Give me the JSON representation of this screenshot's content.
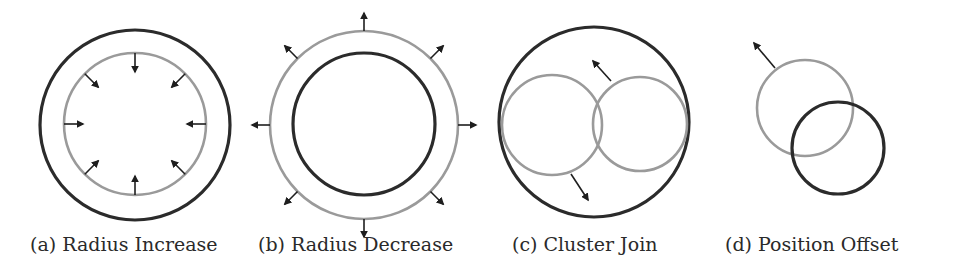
{
  "figure": {
    "colors": {
      "dark": "#2b2b2b",
      "gray": "#9a9a9a",
      "arrow": "#1e1e1e",
      "background": "#ffffff"
    },
    "panels": [
      {
        "id": "a",
        "caption": "(a) Radius Increase",
        "circles": [
          {
            "role": "outer",
            "cx": 135,
            "cy": 125,
            "r": 95,
            "color": "dark"
          },
          {
            "role": "inner",
            "cx": 135,
            "cy": 124,
            "r": 71,
            "color": "gray"
          }
        ],
        "arrows": {
          "center": [
            135,
            124
          ],
          "from_r": 71,
          "to_r": 52,
          "count": 8,
          "direction": "inward"
        }
      },
      {
        "id": "b",
        "caption": "(b) Radius Decrease",
        "circles": [
          {
            "role": "outer",
            "cx": 364,
            "cy": 125,
            "r": 94,
            "color": "gray"
          },
          {
            "role": "inner",
            "cx": 364,
            "cy": 124,
            "r": 71,
            "color": "dark"
          }
        ],
        "arrows": {
          "center": [
            364,
            125
          ],
          "from_r": 94,
          "to_r": 112,
          "count": 8,
          "direction": "outward"
        }
      },
      {
        "id": "c",
        "caption": "(c) Cluster Join",
        "circles": [
          {
            "role": "outer",
            "cx": 594,
            "cy": 122,
            "r": 95,
            "color": "dark"
          },
          {
            "role": "left",
            "cx": 552,
            "cy": 125,
            "r": 50,
            "color": "gray"
          },
          {
            "role": "right",
            "cx": 640,
            "cy": 124,
            "r": 47,
            "color": "gray"
          }
        ],
        "arrow_list": [
          {
            "x1": 611,
            "y1": 81,
            "x2": 593,
            "y2": 61
          },
          {
            "x1": 571,
            "y1": 174,
            "x2": 588,
            "y2": 200
          }
        ]
      },
      {
        "id": "d",
        "caption": "(d) Position Offset",
        "circles": [
          {
            "role": "original",
            "cx": 805,
            "cy": 108,
            "r": 48,
            "color": "gray"
          },
          {
            "role": "offset",
            "cx": 838,
            "cy": 148,
            "r": 46,
            "color": "dark"
          }
        ],
        "arrow_list": [
          {
            "x1": 775,
            "y1": 68,
            "x2": 754,
            "y2": 43
          }
        ]
      }
    ]
  }
}
